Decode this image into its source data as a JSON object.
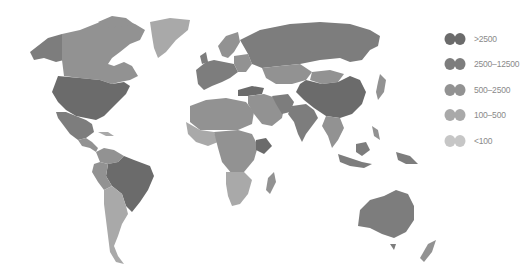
{
  "map": {
    "type": "choropleth-world-map",
    "colors": {
      "c1": "#6b6b6b",
      "c2": "#7d7d7d",
      "c3": "#929292",
      "c4": "#a9a9a9",
      "c5": "#c6c6c6"
    }
  },
  "legend": {
    "items": [
      {
        "label": ">2500",
        "color": "#6b6b6b",
        "icon": "globe-swatch-icon"
      },
      {
        "label": "2500–12500",
        "color": "#7d7d7d",
        "icon": "globe-swatch-icon"
      },
      {
        "label": "500–2500",
        "color": "#929292",
        "icon": "globe-swatch-icon"
      },
      {
        "label": "100–500",
        "color": "#a9a9a9",
        "icon": "globe-swatch-icon"
      },
      {
        "label": "<100",
        "color": "#c6c6c6",
        "icon": "globe-swatch-icon"
      }
    ]
  }
}
